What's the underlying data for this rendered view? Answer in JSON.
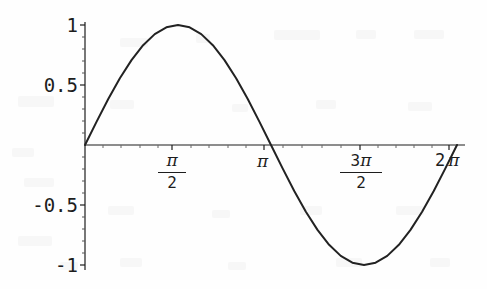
{
  "figure": {
    "width": 487,
    "height": 289,
    "background_color": "#fefefe",
    "ink_color": "#1d1d1d",
    "curve_color": "#222222"
  },
  "axes": {
    "x_axis_name": "horizontal-axis",
    "y_axis_name": "vertical-axis",
    "origin_px": {
      "x": 85,
      "y": 145
    },
    "x_px_start": 85,
    "x_px_end": 465,
    "y_px_top": 22,
    "y_px_bottom": 270,
    "px_per_x_unit": 58.887,
    "px_per_y_unit": 120
  },
  "y_ticks": [
    {
      "label": "1",
      "value": 1,
      "py": 25
    },
    {
      "label": "0.5",
      "value": 0.5,
      "py": 85
    },
    {
      "label": "-0.5",
      "value": -0.5,
      "py": 205
    },
    {
      "label": "-1",
      "value": -1,
      "py": 265
    }
  ],
  "x_ticks": [
    {
      "label": "π/2",
      "kind": "fraction",
      "numerator": "π",
      "coefficient": "",
      "denominator": "2",
      "value": 1.5708,
      "px": 172
    },
    {
      "label": "π",
      "kind": "plain",
      "numerator": "π",
      "coefficient": "",
      "denominator": "",
      "value": 3.1416,
      "px": 264
    },
    {
      "label": "3π/2",
      "kind": "fraction",
      "numerator": "π",
      "coefficient": "3",
      "denominator": "2",
      "value": 4.7124,
      "px": 360
    },
    {
      "label": "2π",
      "kind": "plain",
      "numerator": "π",
      "coefficient": "2",
      "denominator": "",
      "value": 6.2832,
      "px": 449
    }
  ],
  "chart_data": {
    "type": "line",
    "title": "",
    "subtitle": "",
    "xlabel": "",
    "ylabel": "",
    "function": "sin(x)",
    "grid": false,
    "legend": false,
    "legend_position": "none",
    "xlim": [
      0,
      6.2832
    ],
    "ylim": [
      -1,
      1
    ],
    "xtick_labels": [
      "π/2",
      "π",
      "3 π/2",
      "2 π"
    ],
    "xtick_values": [
      1.5708,
      3.1416,
      4.7124,
      6.2832
    ],
    "ytick_labels": [
      "1",
      "0.5",
      "-0.5",
      "-1"
    ],
    "ytick_values": [
      1,
      0.5,
      -0.5,
      -1
    ],
    "series": [
      {
        "name": "sin(x)",
        "color": "#222222",
        "line_width": 2,
        "x": [
          0,
          0.1963,
          0.3927,
          0.589,
          0.7854,
          0.9817,
          1.1781,
          1.3744,
          1.5708,
          1.7671,
          1.9635,
          2.1598,
          2.3562,
          2.5525,
          2.7489,
          2.9452,
          3.1416,
          3.3379,
          3.5343,
          3.7306,
          3.927,
          4.1233,
          4.3197,
          4.516,
          4.7124,
          4.9087,
          5.1051,
          5.3014,
          5.4978,
          5.6941,
          5.8905,
          6.0868,
          6.2832
        ],
        "y": [
          0,
          0.1951,
          0.3827,
          0.5556,
          0.7071,
          0.8315,
          0.9239,
          0.9808,
          1,
          0.9808,
          0.9239,
          0.8315,
          0.7071,
          0.5556,
          0.3827,
          0.1951,
          0,
          -0.1951,
          -0.3827,
          -0.5556,
          -0.7071,
          -0.8315,
          -0.9239,
          -0.9808,
          -1,
          -0.9808,
          -0.9239,
          -0.8315,
          -0.7071,
          -0.5556,
          -0.3827,
          -0.1951,
          0
        ]
      }
    ],
    "annotations": [
      {
        "name": "maximum",
        "x": 1.5708,
        "y": 1
      },
      {
        "name": "minimum",
        "x": 4.7124,
        "y": -1
      },
      {
        "name": "zero-crossing-start",
        "x": 0,
        "y": 0
      },
      {
        "name": "zero-crossing-mid",
        "x": 3.1416,
        "y": 0
      },
      {
        "name": "zero-crossing-end",
        "x": 6.2832,
        "y": 0
      }
    ]
  }
}
